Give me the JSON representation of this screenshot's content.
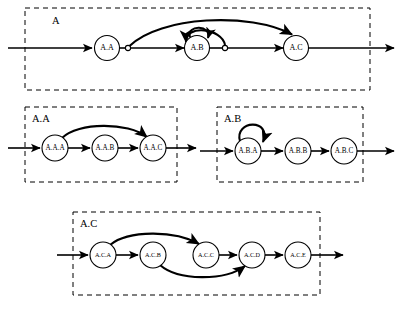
{
  "diagram": {
    "type": "statechart",
    "background_color": "#ffffff",
    "line_color": "#000000",
    "groups": [
      {
        "id": "A",
        "label": "A",
        "label_x": 52,
        "label_y": 22,
        "box": {
          "x": 25,
          "y": 8,
          "w": 345,
          "h": 82
        },
        "nodes": [
          {
            "id": "A.A",
            "label": "A.A",
            "cx": 107,
            "cy": 48,
            "r": 12.5,
            "size": "top"
          },
          {
            "id": "A.B",
            "label": "A.B",
            "cx": 197,
            "cy": 48,
            "r": 12.5,
            "size": "top"
          },
          {
            "id": "A.C",
            "label": "A.C",
            "cx": 296,
            "cy": 48,
            "r": 12.5,
            "size": "top"
          }
        ],
        "junctions": [
          {
            "id": "j-AA-out",
            "cx": 128,
            "cy": 48,
            "r": 2.6
          },
          {
            "id": "j-AB-out",
            "cx": 225,
            "cy": 48,
            "r": 2.6
          }
        ],
        "entry_arrow": {
          "x1": 8,
          "y1": 48,
          "x2": 92,
          "y2": 48
        },
        "exit_arrow": {
          "x1": 309,
          "y1": 48,
          "x2": 394,
          "y2": 48
        },
        "edges": [
          {
            "id": "AA-to-j",
            "kind": "line",
            "from": "A.A",
            "to": "j-AA-out"
          },
          {
            "id": "j-to-AB",
            "kind": "line-arrow",
            "from": "j-AA-out",
            "to": "A.B"
          },
          {
            "id": "AB-to-j2",
            "kind": "line",
            "from": "A.B",
            "to": "j-AB-out"
          },
          {
            "id": "j2-to-AC",
            "kind": "line-arrow",
            "from": "j-AB-out",
            "to": "A.C"
          },
          {
            "id": "j-bypass-to-AC",
            "kind": "arc-over",
            "from": "j-AA-out",
            "to": "A.C"
          },
          {
            "id": "AB-self-loop",
            "kind": "self-loop",
            "from": "A.B",
            "to": "A.B"
          },
          {
            "id": "j2-loopback-to-AB",
            "kind": "arc-back",
            "from": "j-AB-out",
            "to": "A.B"
          }
        ]
      },
      {
        "id": "A.A",
        "label": "A.A",
        "label_x": 32,
        "label_y": 120,
        "box": {
          "x": 25,
          "y": 107,
          "w": 152,
          "h": 75
        },
        "nodes": [
          {
            "id": "A.A.A",
            "label": "A.A.A",
            "cx": 55,
            "cy": 148,
            "r": 13,
            "size": "three"
          },
          {
            "id": "A.A.B",
            "label": "A.A.B",
            "cx": 105,
            "cy": 148,
            "r": 13,
            "size": "three"
          },
          {
            "id": "A.A.C",
            "label": "A.A.C",
            "cx": 153,
            "cy": 148,
            "r": 13,
            "size": "three"
          }
        ],
        "junctions": [],
        "entry_arrow": {
          "x1": 8,
          "y1": 148,
          "x2": 41,
          "y2": 148
        },
        "exit_arrow": {
          "x1": 166,
          "y1": 148,
          "x2": 196,
          "y2": 148
        },
        "edges": [
          {
            "id": "AAA-to-AAB",
            "kind": "line-arrow",
            "from": "A.A.A",
            "to": "A.A.B"
          },
          {
            "id": "AAB-to-AAC",
            "kind": "line-arrow",
            "from": "A.A.B",
            "to": "A.A.C"
          },
          {
            "id": "AAA-bypass-AAC",
            "kind": "arc-over",
            "from": "A.A.A",
            "to": "A.A.C"
          }
        ]
      },
      {
        "id": "A.B",
        "label": "A.B",
        "label_x": 224,
        "label_y": 120,
        "box": {
          "x": 217,
          "y": 107,
          "w": 146,
          "h": 75
        },
        "nodes": [
          {
            "id": "A.B.A",
            "label": "A.B.A",
            "cx": 248,
            "cy": 151,
            "r": 13,
            "size": "three"
          },
          {
            "id": "A.B.B",
            "label": "A.B.B",
            "cx": 298,
            "cy": 151,
            "r": 13,
            "size": "three"
          },
          {
            "id": "A.B.C",
            "label": "A.B.C",
            "cx": 344,
            "cy": 151,
            "r": 13,
            "size": "three"
          }
        ],
        "junctions": [],
        "entry_arrow": {
          "x1": 200,
          "y1": 151,
          "x2": 234,
          "y2": 151
        },
        "exit_arrow": {
          "x1": 357,
          "y1": 151,
          "x2": 394,
          "y2": 151
        },
        "edges": [
          {
            "id": "ABA-self-loop",
            "kind": "self-loop",
            "from": "A.B.A",
            "to": "A.B.A"
          },
          {
            "id": "ABA-to-ABB",
            "kind": "line-arrow",
            "from": "A.B.A",
            "to": "A.B.B"
          },
          {
            "id": "ABB-to-ABC",
            "kind": "line-arrow",
            "from": "A.B.B",
            "to": "A.B.C"
          }
        ]
      },
      {
        "id": "A.C",
        "label": "A.C",
        "label_x": 80,
        "label_y": 225,
        "box": {
          "x": 73,
          "y": 212,
          "w": 247,
          "h": 83
        },
        "nodes": [
          {
            "id": "A.C.A",
            "label": "A.C.A",
            "cx": 103,
            "cy": 255,
            "r": 13,
            "size": "five"
          },
          {
            "id": "A.C.B",
            "label": "A.C.B",
            "cx": 153,
            "cy": 255,
            "r": 13,
            "size": "five"
          },
          {
            "id": "A.C.C",
            "label": "A.C.C",
            "cx": 206,
            "cy": 255,
            "r": 13,
            "size": "five"
          },
          {
            "id": "A.C.D",
            "label": "A.C.D",
            "cx": 252,
            "cy": 255,
            "r": 13,
            "size": "five"
          },
          {
            "id": "A.C.E",
            "label": "A.C.E",
            "cx": 298,
            "cy": 255,
            "r": 13,
            "size": "five"
          }
        ],
        "junctions": [],
        "entry_arrow": {
          "x1": 57,
          "y1": 255,
          "x2": 89,
          "y2": 255
        },
        "exit_arrow": {
          "x1": 311,
          "y1": 255,
          "x2": 343,
          "y2": 255
        },
        "edges": [
          {
            "id": "ACA-to-ACB",
            "kind": "line-arrow",
            "from": "A.C.A",
            "to": "A.C.B"
          },
          {
            "id": "ACC-to-ACD",
            "kind": "line-arrow",
            "from": "A.C.C",
            "to": "A.C.D"
          },
          {
            "id": "ACD-to-ACE",
            "kind": "line-arrow",
            "from": "A.C.D",
            "to": "A.C.E"
          },
          {
            "id": "ACA-bypass-ACC",
            "kind": "arc-over",
            "from": "A.C.A",
            "to": "A.C.C"
          },
          {
            "id": "ACB-bypass-ACD",
            "kind": "arc-under",
            "from": "A.C.B",
            "to": "A.C.D"
          }
        ]
      }
    ]
  }
}
